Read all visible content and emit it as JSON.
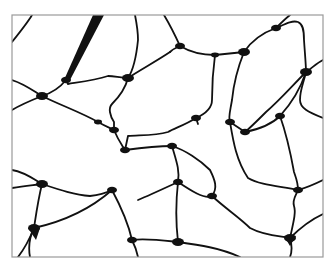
{
  "figure": {
    "frame": {
      "x": 12,
      "y": 15,
      "width": 311,
      "height": 242,
      "border_color": "#9a9a9a"
    },
    "colors": {
      "background": "#ffffff",
      "cell_fill": "#ffffff",
      "wall": "#111111",
      "junction": "#111111"
    },
    "wall_paths": [
      "M12,42 C20,32 28,22 32,15",
      "M12,80 C25,84 35,92 42,96",
      "M12,110 C22,104 32,100 42,96",
      "M42,96 C55,92 62,85 66,80",
      "M42,96 C60,105 80,112 98,122 C105,126 110,128 114,130",
      "M66,80 C75,60 85,40 96,22 L100,15",
      "M66,80 L68,84 C80,82 95,80 108,76 C115,76 120,78 128,78",
      "M128,78 C132,72 136,60 138,40 C138,30 136,20 135,15",
      "M128,78 C140,70 155,62 170,52",
      "M128,78 C125,90 118,98 112,104 C108,108 110,116 114,122 L114,130",
      "M114,130 C118,140 122,145 125,150",
      "M164,15 C170,25 175,35 180,46",
      "M180,46 C175,48 172,50 170,52",
      "M180,46 C190,52 200,55 215,55 L244,52",
      "M244,52 C252,40 262,33 276,28",
      "M276,28 C282,22 286,18 290,15",
      "M276,28 C285,24 292,20 298,22 C303,24 304,30 304,40 C305,55 306,65 306,72",
      "M306,72 C312,68 318,62 323,60",
      "M306,72 C303,85 300,90 300,100 C300,108 308,112 323,118",
      "M244,52 C240,62 234,80 232,100 C230,112 228,118 230,122",
      "M215,55 C213,70 212,85 212,100 C212,108 205,114 196,118",
      "M196,118 C185,125 175,128 168,132 C155,136 140,135 128,136 L125,150",
      "M196,118 L198,124",
      "M306,72 C300,90 290,105 280,116 C270,126 255,130 245,132",
      "M230,122 L245,132",
      "M245,132 C250,128 258,120 266,112 C280,100 292,86 306,72",
      "M125,150 C140,148 160,146 172,146",
      "M172,146 C185,150 200,160 210,170 C215,180 218,188 212,196",
      "M172,146 C176,160 180,170 178,182",
      "M178,182 C165,188 150,195 138,200",
      "M12,170 C25,172 35,180 42,184",
      "M12,188 C25,186 35,185 42,184",
      "M42,184 C60,190 75,195 90,196 C100,195 108,192 112,190",
      "M42,184 C38,200 36,215 34,228",
      "M34,228 C30,238 25,248 18,257",
      "M34,228 C30,236 28,246 30,257",
      "M112,190 C95,205 70,220 34,228",
      "M112,190 C120,205 128,222 132,240",
      "M132,240 C145,238 160,240 178,242",
      "M132,240 C135,246 137,252 138,257",
      "M178,182 C190,190 205,200 212,196",
      "M178,182 C176,200 176,225 178,242",
      "M212,196 C225,208 240,218 250,228 C265,236 280,236 290,238",
      "M290,238 C300,228 310,220 323,214",
      "M290,238 C292,245 292,252 290,257",
      "M178,242 C200,245 220,248 240,257",
      "M280,116 C285,130 290,150 294,172 C296,178 298,182 298,190",
      "M298,190 C305,188 315,184 323,180",
      "M298,190 C296,195 292,200 294,206 C296,212 294,220 290,238",
      "M230,122 C233,140 236,160 248,178 C260,185 278,186 298,190"
    ],
    "junctions": [
      {
        "x": 42,
        "y": 96,
        "r": 5
      },
      {
        "x": 66,
        "y": 80,
        "r": 4
      },
      {
        "x": 128,
        "y": 78,
        "r": 5
      },
      {
        "x": 114,
        "y": 130,
        "r": 4
      },
      {
        "x": 125,
        "y": 150,
        "r": 4
      },
      {
        "x": 180,
        "y": 46,
        "r": 4
      },
      {
        "x": 215,
        "y": 55,
        "r": 3
      },
      {
        "x": 244,
        "y": 52,
        "r": 5
      },
      {
        "x": 276,
        "y": 28,
        "r": 4
      },
      {
        "x": 306,
        "y": 72,
        "r": 5
      },
      {
        "x": 196,
        "y": 118,
        "r": 4
      },
      {
        "x": 230,
        "y": 122,
        "r": 4
      },
      {
        "x": 245,
        "y": 132,
        "r": 4
      },
      {
        "x": 280,
        "y": 116,
        "r": 4
      },
      {
        "x": 172,
        "y": 146,
        "r": 4
      },
      {
        "x": 178,
        "y": 182,
        "r": 4
      },
      {
        "x": 42,
        "y": 184,
        "r": 5
      },
      {
        "x": 112,
        "y": 190,
        "r": 4
      },
      {
        "x": 34,
        "y": 228,
        "r": 5
      },
      {
        "x": 132,
        "y": 240,
        "r": 4
      },
      {
        "x": 178,
        "y": 242,
        "r": 5
      },
      {
        "x": 212,
        "y": 196,
        "r": 4
      },
      {
        "x": 290,
        "y": 238,
        "r": 5
      },
      {
        "x": 298,
        "y": 190,
        "r": 4
      },
      {
        "x": 98,
        "y": 122,
        "r": 3
      }
    ],
    "wedges": [
      "M93,15 L104,15 L70,80 L64,80 Z",
      "M28,228 L40,228 L36,240 Z",
      "M284,236 L296,236 L290,246 Z"
    ],
    "caption_clipped": ""
  }
}
